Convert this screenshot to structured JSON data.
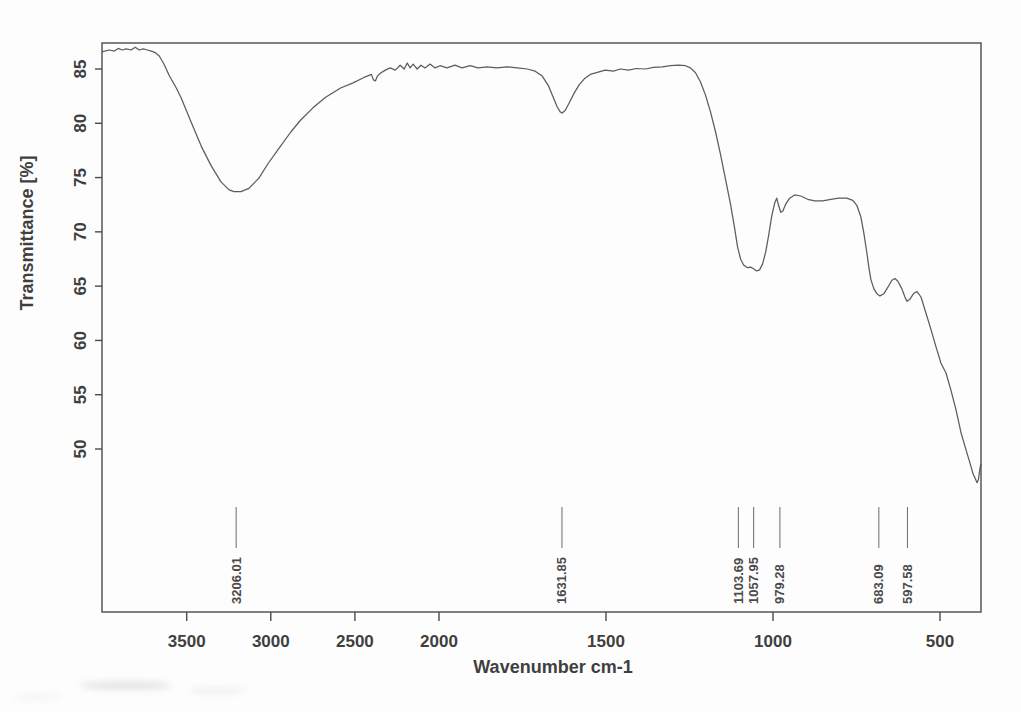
{
  "figure": {
    "background": "#fdfdfd",
    "frame_color": "#4a4a4a",
    "curve_color": "#4a4a4a",
    "text_color": "#3f3f3f"
  },
  "chart_data": {
    "type": "line",
    "xlabel": "Wavenumber cm-1",
    "ylabel": "Transmittance [%]",
    "x_axis": {
      "tick_values": [
        3500,
        3000,
        2500,
        2000,
        1500,
        1000,
        500
      ],
      "tick_labels": [
        "3500",
        "3000",
        "2500",
        "2000",
        "1500",
        "1000",
        "500"
      ],
      "xlim": [
        4000,
        380
      ],
      "scale_break_at": 2000,
      "scale_note": "split linear scale: region 4000-2000 cm-1 is compressed 2x relative to 2000-380 cm-1",
      "grid": false
    },
    "y_axis": {
      "tick_values": [
        85,
        80,
        75,
        70,
        65,
        60,
        55,
        50
      ],
      "tick_labels": [
        "85",
        "80",
        "75",
        "70",
        "65",
        "60",
        "55",
        "50"
      ],
      "ylim": [
        35,
        87.5
      ],
      "grid": false
    },
    "peak_labels": [
      "3206.01",
      "1631.85",
      "1103.69",
      "1057.95",
      "979.28",
      "683.09",
      "597.58"
    ],
    "series": [
      {
        "name": "transmittance-spectrum",
        "points": [
          [
            3998,
            86.6
          ],
          [
            3960,
            86.75
          ],
          [
            3930,
            86.65
          ],
          [
            3907,
            86.9
          ],
          [
            3883,
            86.75
          ],
          [
            3859,
            86.85
          ],
          [
            3830,
            86.75
          ],
          [
            3806,
            87.0
          ],
          [
            3782,
            86.75
          ],
          [
            3758,
            86.85
          ],
          [
            3734,
            86.75
          ],
          [
            3710,
            86.65
          ],
          [
            3686,
            86.5
          ],
          [
            3663,
            86.2
          ],
          [
            3633,
            85.4
          ],
          [
            3604,
            84.4
          ],
          [
            3562,
            83.25
          ],
          [
            3532,
            82.3
          ],
          [
            3473,
            80.1
          ],
          [
            3414,
            77.9
          ],
          [
            3355,
            76.1
          ],
          [
            3296,
            74.6
          ],
          [
            3248,
            73.86
          ],
          [
            3219,
            73.7
          ],
          [
            3177,
            73.7
          ],
          [
            3130,
            74.0
          ],
          [
            3071,
            74.95
          ],
          [
            3018,
            76.25
          ],
          [
            2952,
            77.7
          ],
          [
            2881,
            79.2
          ],
          [
            2822,
            80.3
          ],
          [
            2751,
            81.4
          ],
          [
            2674,
            82.4
          ],
          [
            2585,
            83.25
          ],
          [
            2514,
            83.7
          ],
          [
            2449,
            84.2
          ],
          [
            2402,
            84.5
          ],
          [
            2390,
            84.0
          ],
          [
            2378,
            83.9
          ],
          [
            2366,
            84.35
          ],
          [
            2349,
            84.6
          ],
          [
            2319,
            84.9
          ],
          [
            2290,
            85.1
          ],
          [
            2260,
            84.9
          ],
          [
            2231,
            85.35
          ],
          [
            2207,
            85.0
          ],
          [
            2189,
            85.55
          ],
          [
            2172,
            85.1
          ],
          [
            2154,
            85.45
          ],
          [
            2130,
            85.0
          ],
          [
            2107,
            85.35
          ],
          [
            2083,
            85.1
          ],
          [
            2053,
            85.45
          ],
          [
            2024,
            85.1
          ],
          [
            1997,
            85.3
          ],
          [
            1976,
            85.1
          ],
          [
            1952,
            85.35
          ],
          [
            1931,
            85.1
          ],
          [
            1907,
            85.3
          ],
          [
            1883,
            85.1
          ],
          [
            1856,
            85.2
          ],
          [
            1826,
            85.1
          ],
          [
            1796,
            85.2
          ],
          [
            1766,
            85.1
          ],
          [
            1736,
            85.0
          ],
          [
            1712,
            84.8
          ],
          [
            1691,
            84.35
          ],
          [
            1673,
            83.5
          ],
          [
            1658,
            82.4
          ],
          [
            1646,
            81.5
          ],
          [
            1637,
            81.05
          ],
          [
            1631,
            80.95
          ],
          [
            1622,
            81.2
          ],
          [
            1610,
            81.9
          ],
          [
            1595,
            82.8
          ],
          [
            1580,
            83.55
          ],
          [
            1565,
            84.1
          ],
          [
            1547,
            84.5
          ],
          [
            1526,
            84.7
          ],
          [
            1502,
            84.9
          ],
          [
            1478,
            84.8
          ],
          [
            1457,
            85.0
          ],
          [
            1433,
            84.9
          ],
          [
            1409,
            85.05
          ],
          [
            1382,
            85.0
          ],
          [
            1358,
            85.15
          ],
          [
            1331,
            85.2
          ],
          [
            1307,
            85.3
          ],
          [
            1283,
            85.35
          ],
          [
            1262,
            85.3
          ],
          [
            1247,
            85.1
          ],
          [
            1232,
            84.65
          ],
          [
            1217,
            83.8
          ],
          [
            1202,
            82.6
          ],
          [
            1187,
            81.05
          ],
          [
            1172,
            79.2
          ],
          [
            1157,
            77.1
          ],
          [
            1142,
            74.8
          ],
          [
            1127,
            72.5
          ],
          [
            1115,
            70.35
          ],
          [
            1106,
            68.6
          ],
          [
            1097,
            67.5
          ],
          [
            1088,
            66.95
          ],
          [
            1076,
            66.7
          ],
          [
            1067,
            66.75
          ],
          [
            1058,
            66.6
          ],
          [
            1049,
            66.4
          ],
          [
            1040,
            66.5
          ],
          [
            1031,
            67.05
          ],
          [
            1022,
            68.15
          ],
          [
            1013,
            69.7
          ],
          [
            1004,
            71.45
          ],
          [
            995,
            72.65
          ],
          [
            989,
            73.1
          ],
          [
            983,
            72.4
          ],
          [
            977,
            71.8
          ],
          [
            971,
            71.9
          ],
          [
            962,
            72.55
          ],
          [
            950,
            73.1
          ],
          [
            935,
            73.4
          ],
          [
            917,
            73.3
          ],
          [
            896,
            73.0
          ],
          [
            875,
            72.85
          ],
          [
            851,
            72.85
          ],
          [
            827,
            73.0
          ],
          [
            803,
            73.1
          ],
          [
            779,
            73.1
          ],
          [
            761,
            72.9
          ],
          [
            749,
            72.45
          ],
          [
            737,
            71.4
          ],
          [
            728,
            69.9
          ],
          [
            719,
            68.05
          ],
          [
            713,
            66.7
          ],
          [
            707,
            65.6
          ],
          [
            698,
            64.75
          ],
          [
            689,
            64.3
          ],
          [
            680,
            64.1
          ],
          [
            668,
            64.3
          ],
          [
            656,
            64.9
          ],
          [
            644,
            65.55
          ],
          [
            635,
            65.7
          ],
          [
            626,
            65.45
          ],
          [
            614,
            64.75
          ],
          [
            605,
            64.0
          ],
          [
            599,
            63.6
          ],
          [
            590,
            63.8
          ],
          [
            578,
            64.35
          ],
          [
            569,
            64.5
          ],
          [
            557,
            64.0
          ],
          [
            542,
            62.5
          ],
          [
            527,
            61.0
          ],
          [
            512,
            59.4
          ],
          [
            497,
            57.9
          ],
          [
            482,
            57.0
          ],
          [
            467,
            55.4
          ],
          [
            452,
            53.6
          ],
          [
            437,
            51.5
          ],
          [
            422,
            49.9
          ],
          [
            407,
            48.35
          ],
          [
            401,
            47.7
          ],
          [
            395,
            47.3
          ],
          [
            389,
            46.9
          ],
          [
            385,
            47.2
          ],
          [
            380,
            48.3
          ],
          [
            377,
            48.6
          ]
        ]
      }
    ]
  }
}
